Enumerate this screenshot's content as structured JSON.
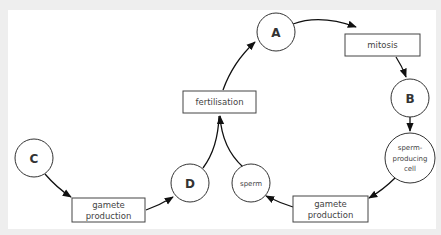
{
  "diagram": {
    "type": "life-cycle",
    "nodes": {
      "A": {
        "label": "A",
        "shape": "circle"
      },
      "B": {
        "label": "B",
        "shape": "circle"
      },
      "C": {
        "label": "C",
        "shape": "circle"
      },
      "D": {
        "label": "D",
        "shape": "circle"
      },
      "mitosis": {
        "label": "mitosis",
        "shape": "box"
      },
      "sperm_producing_cell": {
        "lines": [
          "sperm-",
          "producing",
          "cell"
        ],
        "shape": "circle"
      },
      "gamete_production_right": {
        "lines": [
          "gamete",
          "production"
        ],
        "shape": "box"
      },
      "sperm": {
        "label": "sperm",
        "shape": "circle"
      },
      "fertilisation": {
        "label": "fertilisation",
        "shape": "box"
      },
      "gamete_production_left": {
        "lines": [
          "gamete",
          "production"
        ],
        "shape": "box"
      }
    },
    "edges": [
      {
        "from": "A",
        "to": "mitosis"
      },
      {
        "from": "mitosis",
        "to": "B"
      },
      {
        "from": "B",
        "to": "sperm_producing_cell"
      },
      {
        "from": "sperm_producing_cell",
        "to": "gamete_production_right"
      },
      {
        "from": "gamete_production_right",
        "to": "sperm"
      },
      {
        "from": "sperm",
        "to": "fertilisation"
      },
      {
        "from": "D",
        "to": "fertilisation"
      },
      {
        "from": "fertilisation",
        "to": "A"
      },
      {
        "from": "C",
        "to": "gamete_production_left"
      },
      {
        "from": "gamete_production_left",
        "to": "D"
      }
    ]
  }
}
